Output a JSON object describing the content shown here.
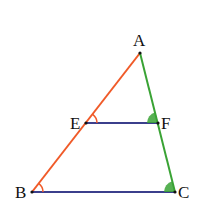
{
  "diagram": {
    "type": "geometry-triangle",
    "points": {
      "A": {
        "label": "A",
        "x": 140,
        "y": 53
      },
      "B": {
        "label": "B",
        "x": 32,
        "y": 192
      },
      "C": {
        "label": "C",
        "x": 175,
        "y": 192
      },
      "E": {
        "label": "E",
        "x": 86,
        "y": 123
      },
      "F": {
        "label": "F",
        "x": 158,
        "y": 123
      }
    },
    "segments": [
      {
        "from": "A",
        "to": "B",
        "color": "#f05a28"
      },
      {
        "from": "A",
        "to": "C",
        "color": "#3aa335"
      },
      {
        "from": "E",
        "to": "F",
        "color": "#3b3f8c"
      },
      {
        "from": "B",
        "to": "C",
        "color": "#3b3f8c"
      }
    ],
    "angle_marks": [
      {
        "vertex": "E",
        "style": "arc",
        "color": "#f05a28"
      },
      {
        "vertex": "B",
        "style": "arc",
        "color": "#f05a28"
      },
      {
        "vertex": "F",
        "style": "filled-sector",
        "color": "#3aa335"
      },
      {
        "vertex": "C",
        "style": "filled-sector",
        "color": "#3aa335"
      }
    ]
  }
}
